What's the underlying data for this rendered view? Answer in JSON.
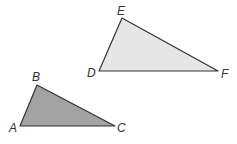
{
  "diagram": {
    "colors": {
      "stroke": "#333333",
      "triangle_abc_fill": "#a3a3a3",
      "triangle_def_fill": "#e6e6e6",
      "label": "#333333"
    },
    "triangles": [
      {
        "name": "DEF",
        "fill": "#e6e6e6",
        "vertices": [
          {
            "label": "D",
            "x": 99,
            "y": 71,
            "lx": 87,
            "ly": 77
          },
          {
            "label": "E",
            "x": 122,
            "y": 18,
            "lx": 117,
            "ly": 15
          },
          {
            "label": "F",
            "x": 218,
            "y": 71,
            "lx": 221,
            "ly": 78
          }
        ]
      },
      {
        "name": "ABC",
        "fill": "#a3a3a3",
        "vertices": [
          {
            "label": "A",
            "x": 20,
            "y": 126,
            "lx": 9,
            "ly": 132
          },
          {
            "label": "B",
            "x": 37,
            "y": 85,
            "lx": 32,
            "ly": 81
          },
          {
            "label": "C",
            "x": 115,
            "y": 126,
            "lx": 117,
            "ly": 132
          }
        ]
      }
    ]
  }
}
